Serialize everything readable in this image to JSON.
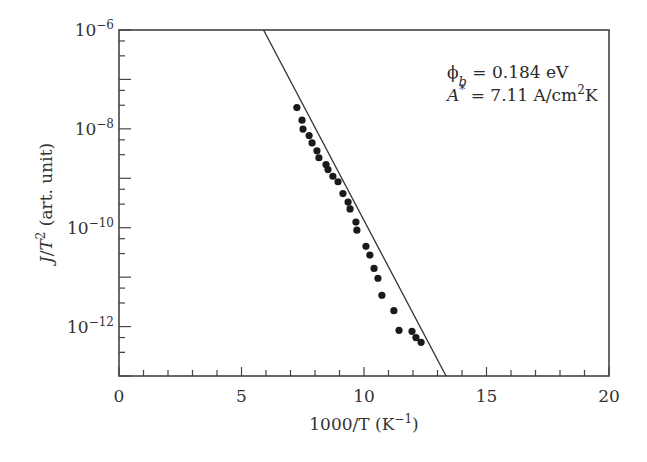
{
  "chart_data": {
    "type": "scatter",
    "title": "",
    "xlabel": "1000/T (K⁻¹)",
    "ylabel": "J/T² (art. unit)",
    "xlim": [
      0,
      20
    ],
    "ylim": [
      1e-13,
      1e-06
    ],
    "yscale": "log",
    "grid": false,
    "legend": null,
    "x_ticks": [
      0,
      5,
      10,
      15,
      20
    ],
    "x_tick_labels": [
      "0",
      "5",
      "10",
      "15",
      "20"
    ],
    "y_ticks": [
      1e-06,
      1e-08,
      1e-10,
      1e-12
    ],
    "y_tick_labels": [
      "10",
      "10",
      "10",
      "10"
    ],
    "y_tick_exponents": [
      "−6",
      "−8",
      "−10",
      "−12"
    ],
    "annotations": [
      {
        "text": "ϕb = 0.184 eV",
        "symbol": "ϕ",
        "sub": "b",
        "rest": " = 0.184 eV"
      },
      {
        "text": "A* = 7.11 A/cm²K",
        "symbol": "A",
        "sup1": "*",
        "rest": " = 7.11 A/cm",
        "sup2": "2",
        "tail": "K"
      }
    ],
    "series": [
      {
        "name": "measured",
        "marker": "filled-circle",
        "color": "#1a1a1a",
        "x": [
          7.26,
          7.47,
          7.51,
          7.76,
          7.88,
          8.08,
          8.16,
          8.45,
          8.53,
          8.73,
          8.94,
          9.14,
          9.35,
          9.43,
          9.67,
          9.71,
          10.08,
          10.24,
          10.41,
          10.57,
          10.73,
          11.22,
          11.43,
          11.96,
          12.12,
          12.33
        ],
        "y": [
          2.7e-08,
          1.5e-08,
          9.9e-09,
          7.3e-09,
          5.2e-09,
          3.6e-09,
          2.6e-09,
          1.9e-09,
          1.5e-09,
          1.1e-09,
          8.5e-10,
          4.9e-10,
          3.3e-10,
          2.4e-10,
          1.3e-10,
          8.9e-11,
          4.2e-11,
          2.8e-11,
          1.5e-11,
          9.5e-12,
          4.3e-12,
          2.1e-12,
          8.4e-13,
          8e-13,
          6e-13,
          4.8e-13
        ]
      },
      {
        "name": "fit",
        "type": "line",
        "color": "#333333",
        "x": [
          5.9,
          13.35
        ],
        "y": [
          1e-06,
          1e-13
        ]
      }
    ]
  }
}
